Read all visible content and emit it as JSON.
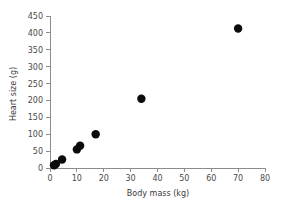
{
  "chart_data": {
    "type": "scatter",
    "title": "",
    "xlabel": "Body mass (kg)",
    "ylabel": "Heart size (g)",
    "xlim": [
      0,
      80
    ],
    "ylim": [
      0,
      450
    ],
    "xticks": [
      0,
      10,
      20,
      30,
      40,
      50,
      60,
      70,
      80
    ],
    "yticks": [
      0,
      50,
      100,
      150,
      200,
      250,
      300,
      350,
      400,
      450
    ],
    "xtick_labels": [
      "0",
      "10",
      "20",
      "30",
      "40",
      "50",
      "60",
      "70",
      "80"
    ],
    "ytick_labels": [
      "0",
      "50",
      "100",
      "150",
      "200",
      "250",
      "300",
      "350",
      "400",
      "450"
    ],
    "grid": false,
    "legend": null,
    "marker": "filled-circle",
    "marker_color": "#0b0b0b",
    "axis_color": "#8c8c8c",
    "series": [
      {
        "name": "",
        "x": [
          1.5,
          2.2,
          4.5,
          10.0,
          11.2,
          17.0,
          34.0,
          70.0
        ],
        "y": [
          8,
          12,
          25,
          55,
          66,
          100,
          205,
          413
        ]
      }
    ]
  },
  "figure": {
    "background_color": "#ffffff",
    "text_color": "#4a4a4a"
  }
}
